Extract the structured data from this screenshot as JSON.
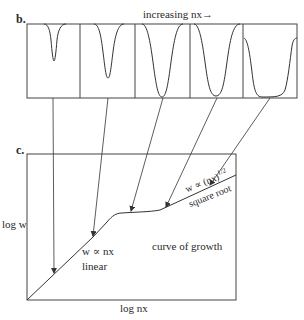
{
  "panel_b": {
    "label": "b.",
    "title": "increasing nx→",
    "profiles": [
      {
        "depth": 0.48,
        "width": 0.3
      },
      {
        "depth": 0.72,
        "width": 0.5
      },
      {
        "depth": 1.0,
        "width": 0.75
      },
      {
        "depth": 1.0,
        "width": 0.95
      },
      {
        "depth": 1.0,
        "width": 1.2
      }
    ]
  },
  "panel_c": {
    "label": "c.",
    "y_axis_label": "log w",
    "x_axis_label": "log nx",
    "linear_relation": "w ∝ nx",
    "linear_label": "linear",
    "sqrt_relation": "w ∝  (nx)¹ᐟ²",
    "sqrt_label": "square root",
    "curve_label": "curve of growth"
  },
  "colors": {
    "line": "#333333",
    "background": "#ffffff"
  }
}
